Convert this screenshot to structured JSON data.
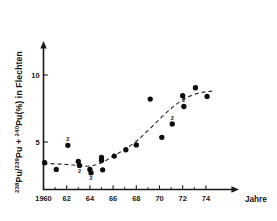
{
  "chart_data": {
    "type": "scatter",
    "title": "",
    "subtitle": "",
    "xlabel": "Jahre",
    "ylabel": "238Pu/239Pu + 240Pu(%) in Flechten",
    "ylabel_parts": [
      {
        "text": "238",
        "sup": true
      },
      {
        "text": "Pu/",
        "sup": false
      },
      {
        "text": "239",
        "sup": true
      },
      {
        "text": "Pu + ",
        "sup": false
      },
      {
        "text": "240",
        "sup": true
      },
      {
        "text": "Pu(%) in  Flechten",
        "sup": false
      }
    ],
    "xlim": [
      1960,
      1975
    ],
    "ylim": [
      1.5,
      11.6
    ],
    "xticks": [
      1960,
      1961,
      1962,
      1963,
      1964,
      1965,
      1966,
      1967,
      1968,
      1969,
      1970,
      1971,
      1972,
      1973,
      1974
    ],
    "xtick_labels": [
      "1960",
      "",
      "62",
      "",
      "64",
      "",
      "66",
      "",
      "68",
      "",
      "70",
      "",
      "72",
      "",
      "74"
    ],
    "yticks": [
      5,
      10
    ],
    "ytick_labels": [
      "5",
      "10"
    ],
    "grid": false,
    "legend": false,
    "marker": "filled-circle",
    "points": [
      {
        "x": 1960.1,
        "y": 3.45,
        "note": ""
      },
      {
        "x": 1961.1,
        "y": 2.95,
        "note": ""
      },
      {
        "x": 1962.1,
        "y": 4.75,
        "note": "2"
      },
      {
        "x": 1963.0,
        "y": 3.55,
        "note": ""
      },
      {
        "x": 1963.1,
        "y": 3.25,
        "note": "2"
      },
      {
        "x": 1964.0,
        "y": 2.95,
        "note": ""
      },
      {
        "x": 1964.1,
        "y": 2.7,
        "note": "2"
      },
      {
        "x": 1965.0,
        "y": 3.85,
        "note": ""
      },
      {
        "x": 1965.0,
        "y": 3.62,
        "note": ""
      },
      {
        "x": 1965.1,
        "y": 2.92,
        "note": ""
      },
      {
        "x": 1966.1,
        "y": 3.95,
        "note": ""
      },
      {
        "x": 1967.1,
        "y": 4.42,
        "note": ""
      },
      {
        "x": 1968.0,
        "y": 4.78,
        "note": ""
      },
      {
        "x": 1969.2,
        "y": 8.2,
        "note": ""
      },
      {
        "x": 1970.2,
        "y": 5.35,
        "note": ""
      },
      {
        "x": 1971.1,
        "y": 6.35,
        "note": "2"
      },
      {
        "x": 1972.0,
        "y": 8.45,
        "note": ""
      },
      {
        "x": 1972.1,
        "y": 7.65,
        "note": "2"
      },
      {
        "x": 1973.1,
        "y": 9.05,
        "note": ""
      },
      {
        "x": 1974.1,
        "y": 8.4,
        "note": ""
      }
    ],
    "fit_curve": {
      "style": "dashed",
      "description": "sigmoidal trend line",
      "points": [
        {
          "x": 1960.0,
          "y": 3.4
        },
        {
          "x": 1961.0,
          "y": 3.37
        },
        {
          "x": 1962.0,
          "y": 3.32
        },
        {
          "x": 1963.0,
          "y": 3.25
        },
        {
          "x": 1964.0,
          "y": 3.2
        },
        {
          "x": 1965.0,
          "y": 3.45
        },
        {
          "x": 1966.0,
          "y": 3.95
        },
        {
          "x": 1967.0,
          "y": 4.45
        },
        {
          "x": 1968.0,
          "y": 5.05
        },
        {
          "x": 1969.0,
          "y": 5.85
        },
        {
          "x": 1970.0,
          "y": 6.7
        },
        {
          "x": 1971.0,
          "y": 7.5
        },
        {
          "x": 1972.0,
          "y": 8.15
        },
        {
          "x": 1973.0,
          "y": 8.55
        },
        {
          "x": 1974.0,
          "y": 8.75
        },
        {
          "x": 1974.8,
          "y": 8.8
        }
      ]
    },
    "annotations": [
      {
        "label": "2",
        "meaning": "number of samples at this point"
      }
    ],
    "colors": {
      "marker": "#0b0b0b",
      "curve": "#2b2b2b",
      "axis": "#1a1a1a",
      "background": "#ffffff"
    }
  }
}
